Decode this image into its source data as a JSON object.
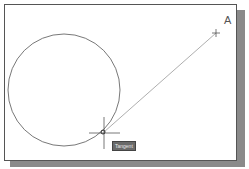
{
  "drawing": {
    "point_label": "A",
    "tooltip": "Tangent",
    "circle": {
      "cx": 64,
      "cy": 90,
      "r": 56
    },
    "line": {
      "x1": 104,
      "y1": 132,
      "x2": 216,
      "y2": 33
    },
    "colors": {
      "stroke": "#555555",
      "line": "#999999",
      "tooltip_bg": "#6a6a6a"
    }
  }
}
